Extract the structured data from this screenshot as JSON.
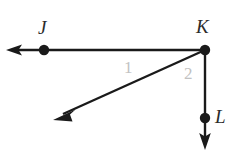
{
  "figure": {
    "kind": "geometry-diagram",
    "background_color": "#ffffff",
    "stroke_color": "#1a1a1a",
    "label_color": "#2b2b2b",
    "angle_label_color": "#c2c2c2",
    "width": 236,
    "height": 153
  },
  "points": [
    {
      "id": "J",
      "label": "J",
      "x": 44,
      "y": 50,
      "label_x": 46,
      "label_y": 28,
      "dot": true
    },
    {
      "id": "K",
      "label": "K",
      "x": 205,
      "y": 50,
      "label_x": 203,
      "label_y": 27,
      "dot": true
    },
    {
      "id": "L",
      "label": "L",
      "x": 205,
      "y": 118,
      "label_x": 222,
      "label_y": 118,
      "dot": true
    }
  ],
  "rays": [
    {
      "id": "ray-KJ",
      "name": "ray-k-to-j",
      "from": "K",
      "through": "J",
      "from_x": 205,
      "from_y": 50,
      "tip_x": 8,
      "tip_y": 50,
      "direction": "left",
      "arrowhead": true
    },
    {
      "id": "ray-K-diagonal",
      "name": "ray-k-diagonal-down-left",
      "from": "K",
      "through": null,
      "from_x": 205,
      "from_y": 50,
      "tip_x": 55,
      "tip_y": 118,
      "direction": "down-left",
      "arrowhead": true
    },
    {
      "id": "ray-KL",
      "name": "ray-k-to-l",
      "from": "K",
      "through": "L",
      "from_x": 205,
      "from_y": 50,
      "tip_x": 205,
      "tip_y": 148,
      "direction": "down",
      "arrowhead": true
    }
  ],
  "angles": [
    {
      "id": "angle-1",
      "label": "1",
      "vertex": "K",
      "between": [
        "ray-KJ",
        "ray-K-diagonal"
      ],
      "label_x": 130,
      "label_y": 68
    },
    {
      "id": "angle-2",
      "label": "2",
      "vertex": "K",
      "between": [
        "ray-K-diagonal",
        "ray-KL"
      ],
      "label_x": 190,
      "label_y": 74
    }
  ]
}
